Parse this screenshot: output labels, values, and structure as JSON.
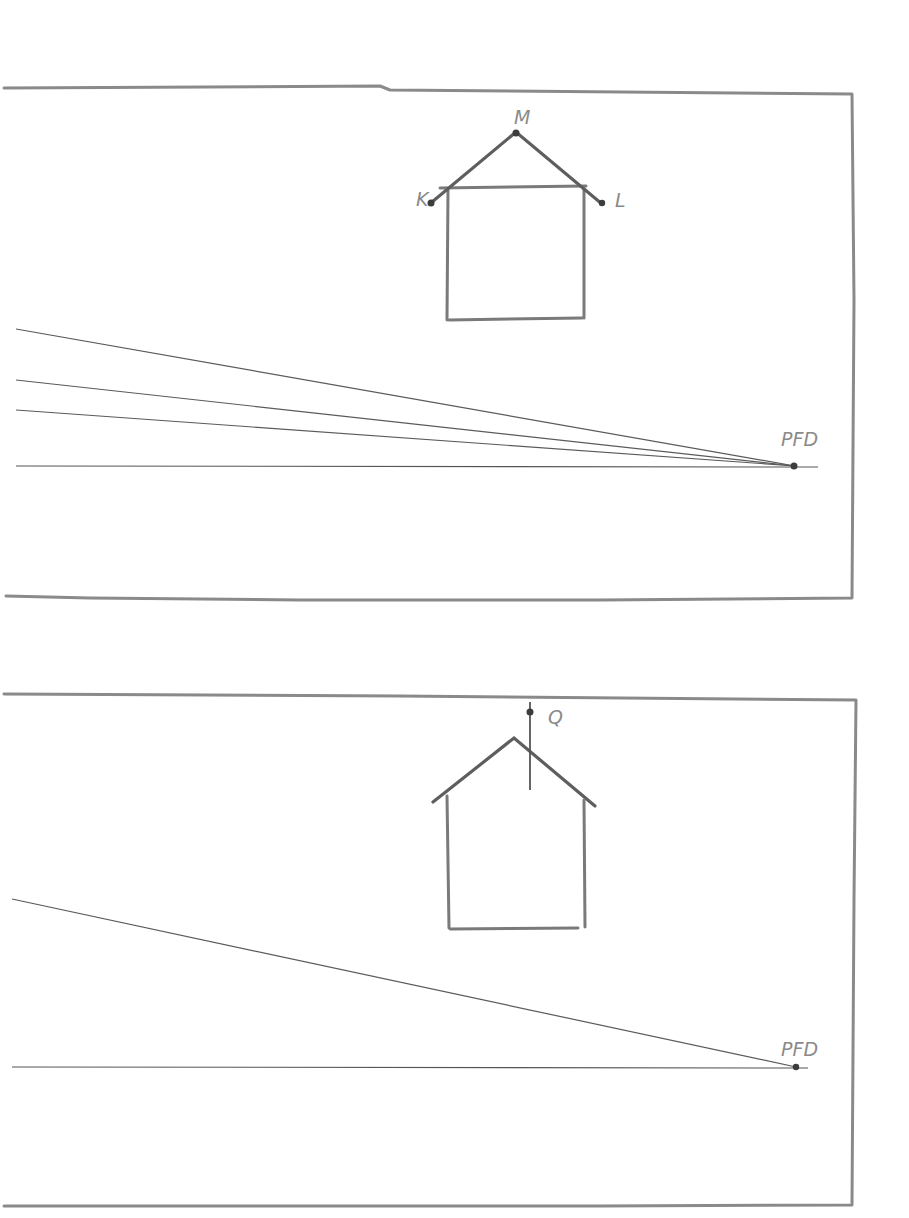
{
  "figure": {
    "colors": {
      "pencil": "#7a7a7a",
      "line": "#5a5a5a",
      "label": "#8a8a8a",
      "background": "#ffffff"
    }
  },
  "panel_top": {
    "points": {
      "M": {
        "label": "M"
      },
      "K": {
        "label": "K"
      },
      "L": {
        "label": "L"
      },
      "vanishing": {
        "label": "PFD"
      }
    }
  },
  "panel_bottom": {
    "points": {
      "Q": {
        "label": "Q"
      },
      "vanishing": {
        "label": "PFD"
      }
    }
  }
}
